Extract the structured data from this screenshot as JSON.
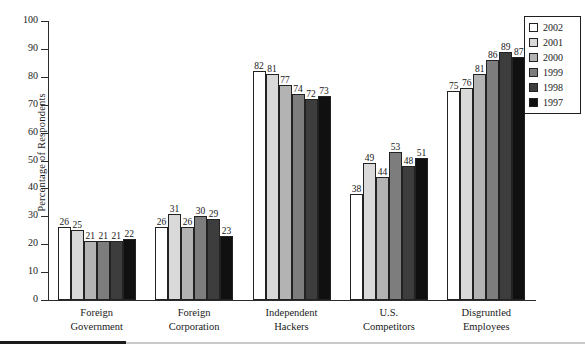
{
  "chart_data": {
    "type": "bar",
    "title": "",
    "xlabel": "",
    "ylabel": "Percentage of Respondents",
    "ylim": [
      0,
      100
    ],
    "ytick_step": 10,
    "yticks": [
      100,
      90,
      80,
      70,
      60,
      50,
      40,
      30,
      20,
      10,
      0
    ],
    "grid": false,
    "legend_position": "top-right",
    "categories": [
      "Foreign Government",
      "Foreign Corporation",
      "Independent Hackers",
      "U.S. Competitors",
      "Disgruntled Employees"
    ],
    "category_lines": [
      [
        "Foreign",
        "Government"
      ],
      [
        "Foreign",
        "Corporation"
      ],
      [
        "Independent",
        "Hackers"
      ],
      [
        "U.S.",
        "Competitors"
      ],
      [
        "Disgruntled",
        "Employees"
      ]
    ],
    "series": [
      {
        "name": "2002",
        "color": "#ffffff",
        "values": [
          26,
          26,
          82,
          38,
          75
        ]
      },
      {
        "name": "2001",
        "color": "#d9d9d9",
        "values": [
          25,
          31,
          81,
          49,
          76
        ]
      },
      {
        "name": "2000",
        "color": "#b3b3b3",
        "values": [
          21,
          26,
          77,
          44,
          81
        ]
      },
      {
        "name": "1999",
        "color": "#7d7d7d",
        "values": [
          21,
          30,
          74,
          53,
          86
        ]
      },
      {
        "name": "1998",
        "color": "#3d3d3d",
        "values": [
          21,
          29,
          72,
          48,
          89
        ]
      },
      {
        "name": "1997",
        "color": "#101010",
        "values": [
          22,
          23,
          73,
          51,
          87
        ]
      }
    ]
  },
  "legend": {
    "items": [
      {
        "label": "2002",
        "color": "#ffffff"
      },
      {
        "label": "2001",
        "color": "#d9d9d9"
      },
      {
        "label": "2000",
        "color": "#b3b3b3"
      },
      {
        "label": "1999",
        "color": "#7d7d7d"
      },
      {
        "label": "1998",
        "color": "#3d3d3d"
      },
      {
        "label": "1997",
        "color": "#101010"
      }
    ]
  },
  "axis": {
    "y_title": "Percentage of Respondents"
  }
}
